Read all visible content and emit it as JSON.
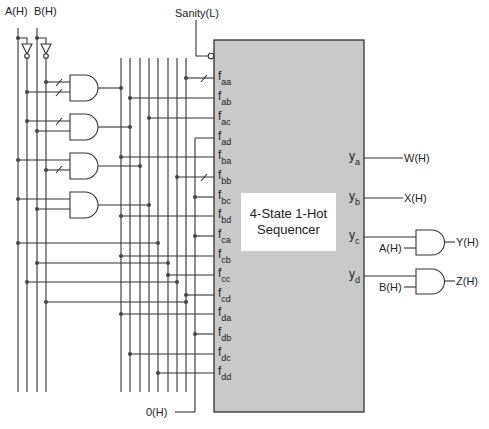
{
  "diagram": {
    "title_line1": "4-State 1-Hot",
    "title_line2": "Sequencer",
    "box_color": "#c9c9c9",
    "inputs": {
      "a": "A(H)",
      "b": "B(H)",
      "sanity": "Sanity(L)",
      "zero": "0(H)"
    },
    "f_inputs": [
      "aa",
      "ab",
      "ac",
      "ad",
      "ba",
      "bb",
      "bc",
      "bd",
      "ca",
      "cb",
      "cc",
      "cd",
      "da",
      "db",
      "dc",
      "dd"
    ],
    "y_outputs": [
      "a",
      "b",
      "c",
      "d"
    ],
    "outputs": {
      "w": "W(H)",
      "x": "X(H)",
      "y": "Y(H)",
      "z": "Z(H)",
      "y_gate_input": "A(H)",
      "z_gate_input": "B(H)"
    }
  }
}
